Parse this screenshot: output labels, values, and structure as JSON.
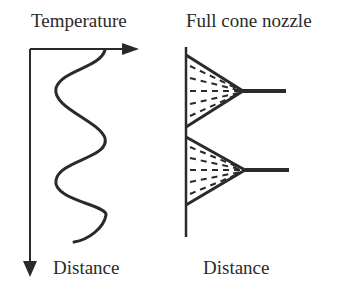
{
  "left_panel": {
    "title": "Temperature",
    "axis_label": "Distance"
  },
  "right_panel": {
    "title": "Full cone nozzle",
    "axis_label": "Distance",
    "nozzle_count": 2
  },
  "colors": {
    "stroke": "#2a2a2a",
    "background": "#ffffff"
  }
}
